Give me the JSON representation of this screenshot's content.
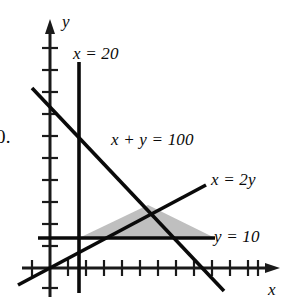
{
  "figure": {
    "problem_number": "0.",
    "axis_labels": {
      "x": "x",
      "y": "y"
    },
    "line_labels": {
      "vertical_line": "x = 20",
      "diagonal_sum": "x + y = 100",
      "diagonal_ratio": "x = 2y",
      "horizontal_line": "y = 10"
    },
    "colors": {
      "ink": "#0a0a0a",
      "shade": "#bfbfbf",
      "background": "#ffffff"
    }
  },
  "chart_data": {
    "type": "line",
    "title": "",
    "subtitle": "",
    "xlabel": "x",
    "ylabel": "y",
    "grid": false,
    "legend": "none",
    "axes": {
      "x_axis_pixel_y": 268,
      "y_axis_pixel_x": 50,
      "x_tick_count": 13,
      "y_tick_count": 11,
      "x_tick_spacing_px": 18,
      "y_tick_spacing_px": 22,
      "x_arrow": true,
      "y_arrow": true,
      "origin_px": [
        50,
        268
      ]
    },
    "series": [
      {
        "name": "x = 20",
        "equation": "x = 20",
        "kind": "vertical-line",
        "label": "x = 20",
        "pixel_start": [
          79,
          62
        ],
        "pixel_end": [
          79,
          293
        ]
      },
      {
        "name": "x + y = 100",
        "equation": "x + y = 100",
        "kind": "line",
        "label": "x + y = 100",
        "pixel_start": [
          32,
          88
        ],
        "pixel_end": [
          224,
          291
        ]
      },
      {
        "name": "x = 2y",
        "equation": "x = 2y",
        "kind": "line",
        "label": "x = 2y",
        "pixel_start": [
          18,
          285
        ],
        "pixel_end": [
          206,
          185
        ]
      },
      {
        "name": "y = 10",
        "equation": "y = 10",
        "kind": "horizontal-line",
        "label": "y = 10",
        "pixel_start": [
          38,
          238
        ],
        "pixel_end": [
          215,
          238
        ]
      }
    ],
    "shaded_region": {
      "name": "feasible-region",
      "fill": "#bfbfbf",
      "vertices_px": [
        [
          79,
          238
        ],
        [
          215,
          238
        ],
        [
          148,
          205
        ]
      ],
      "vertices_math": [
        [
          20,
          10
        ],
        [
          90,
          10
        ],
        [
          66.7,
          33.3
        ]
      ]
    },
    "annotations": [
      {
        "text": "x = 20",
        "at_px": [
          73,
          45
        ]
      },
      {
        "text": "x + y = 100",
        "at_px": [
          111,
          131
        ]
      },
      {
        "text": "x = 2y",
        "at_px": [
          211,
          171
        ]
      },
      {
        "text": "y = 10",
        "at_px": [
          214,
          228
        ]
      },
      {
        "text": "y",
        "at_px": [
          62,
          13
        ]
      },
      {
        "text": "x",
        "at_px": [
          268,
          281
        ]
      },
      {
        "text": "0.",
        "at_px": [
          -4,
          127
        ]
      }
    ]
  }
}
